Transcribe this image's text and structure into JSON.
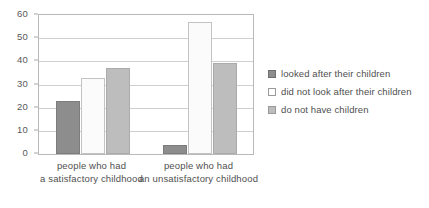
{
  "chart_data": {
    "type": "bar",
    "title": "",
    "xlabel": "",
    "ylabel": "",
    "categories": [
      "people who had\na satisfactory childhood",
      "people who had\nan unsatisfactory childhood"
    ],
    "category_lines": [
      [
        "people who had",
        "a satisfactory childhood"
      ],
      [
        "people who had",
        "an unsatisfactory childhood"
      ]
    ],
    "series": [
      {
        "name": "looked after their children",
        "values": [
          23,
          4
        ],
        "color": "#8d8d8d"
      },
      {
        "name": "did not look after their children",
        "values": [
          33,
          57
        ],
        "color": "#fbfbfb"
      },
      {
        "name": "do not have children",
        "values": [
          37,
          39.5
        ],
        "color": "#bdbdbd"
      }
    ],
    "ylim": [
      0,
      60
    ],
    "y_ticks": [
      0,
      10,
      20,
      30,
      40,
      50,
      60
    ],
    "y_tick_labels": [
      "0",
      "10",
      "20",
      "30",
      "40",
      "50",
      "60"
    ],
    "grid": "horizontal",
    "legend_position": "right"
  },
  "legend": {
    "items": [
      {
        "label": "looked after their children",
        "swatch": "legend-swatch-dark"
      },
      {
        "label": "did not look after their children",
        "swatch": "legend-swatch-white"
      },
      {
        "label": "do not have children",
        "swatch": "legend-swatch-gray"
      }
    ]
  }
}
